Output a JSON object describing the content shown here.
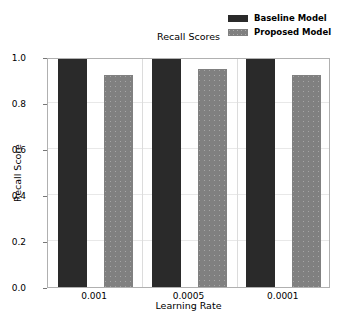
{
  "chart_data": {
    "type": "bar",
    "title": "Recall Scores",
    "xlabel": "Learning Rate",
    "ylabel": "Recall Score",
    "categories": [
      "0.001",
      "0.0005",
      "0.0001"
    ],
    "series": [
      {
        "name": "Baseline Model",
        "values": [
          1.0,
          1.0,
          1.0
        ],
        "color": "#2a2a2a"
      },
      {
        "name": "Proposed Model",
        "values": [
          0.92,
          0.95,
          0.92
        ],
        "color": "#808080"
      }
    ],
    "ylim": [
      0.0,
      1.0
    ],
    "yticks": [
      "0.0",
      "0.2",
      "0.4",
      "0.6",
      "0.8",
      "1.0"
    ],
    "ytick_values": [
      0.0,
      0.2,
      0.4,
      0.6,
      0.8,
      1.0
    ],
    "grid": true,
    "legend_position": "upper right (outside axes)"
  },
  "colors": {
    "baseline": "#2a2a2a",
    "proposed": "#808080",
    "axis": "#b0b0b0",
    "grid": "#e8e8e8",
    "background": "#ffffff"
  }
}
